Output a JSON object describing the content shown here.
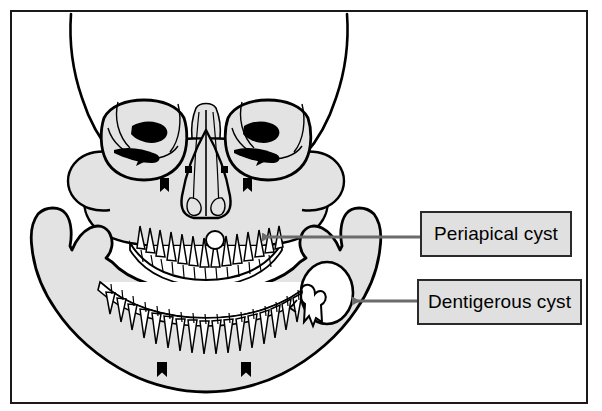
{
  "figure": {
    "kind": "anatomical-illustration",
    "background_color": "#ffffff",
    "frame_color": "#1a1a1a",
    "bone_fill_color": "#e3e3e3",
    "bone_outline_color": "#000000",
    "cyst_fill_color": "#ffffff",
    "leader_line_color": "#6b6b6b"
  },
  "callouts": [
    {
      "id": "periapical",
      "label": "Periapical cyst",
      "box_fill": "#e0e0e0",
      "box_border": "#2a2a2a",
      "arrow_direction": "left",
      "points_to": "small round radiolucency at apex of upper anterior tooth root"
    },
    {
      "id": "dentigerous",
      "label": "Dentigerous cyst",
      "box_fill": "#e0e0e0",
      "box_border": "#2a2a2a",
      "arrow_direction": "left",
      "points_to": "large oval radiolucency surrounding impacted molar in right mandibular ramus"
    }
  ],
  "anatomy": {
    "structures": [
      "cranial vault",
      "frontal bone",
      "left orbit",
      "right orbit",
      "superior orbital fissure",
      "nasal aperture",
      "nasal septum",
      "infraorbital foramen",
      "maxilla",
      "maxillary teeth",
      "mandible",
      "mandibular teeth",
      "mandibular ramus",
      "condylar process",
      "coronoid process",
      "mental foramen",
      "impacted molar"
    ]
  }
}
